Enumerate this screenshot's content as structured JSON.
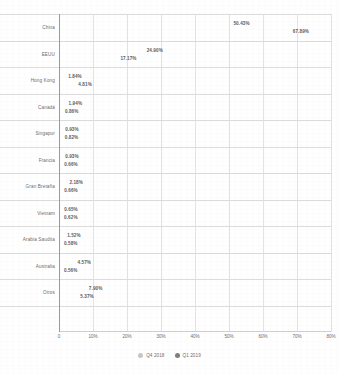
{
  "chart_data": {
    "type": "bar",
    "orientation": "horizontal",
    "title": "",
    "xlabel": "",
    "ylabel": "",
    "xlim": [
      0,
      80
    ],
    "grid": true,
    "legend_position": "bottom",
    "xticks": [
      "0",
      "10%",
      "20%",
      "30%",
      "40%",
      "50%",
      "60%",
      "70%",
      "80%"
    ],
    "xtick_values": [
      0,
      10,
      20,
      30,
      40,
      50,
      60,
      70,
      80
    ],
    "categories": [
      "China",
      "EEUU",
      "Hong Kong",
      "Canadá",
      "Singapur",
      "Francia",
      "Gran Bretaña",
      "Vietnam",
      "Arabia Saudita",
      "Australia",
      "Otros"
    ],
    "series": [
      {
        "name": "Q4 2018",
        "color": "#c7c7c7",
        "values": [
          50.43,
          24.9,
          1.84,
          1.94,
          0.93,
          0.93,
          2.18,
          0.65,
          1.52,
          4.57,
          7.9
        ],
        "labels": [
          "50.43%",
          "24.90%",
          "1.84%",
          "1.94%",
          "0.93%",
          "0.93%",
          "2.18%",
          "0.65%",
          "1.52%",
          "4.57%",
          "7.90%"
        ]
      },
      {
        "name": "Q1 2019",
        "color": "#7f7f7f",
        "values": [
          67.89,
          17.17,
          4.81,
          0.86,
          0.82,
          0.66,
          0.66,
          0.62,
          0.58,
          0.56,
          5.37
        ],
        "labels": [
          "67.89%",
          "17.17%",
          "4.81%",
          "0.86%",
          "0.82%",
          "0.66%",
          "0.66%",
          "0.62%",
          "0.58%",
          "0.56%",
          "5.37%"
        ]
      }
    ]
  },
  "legend": {
    "items": [
      {
        "label": "Q4 2018"
      },
      {
        "label": "Q1 2019"
      }
    ]
  }
}
